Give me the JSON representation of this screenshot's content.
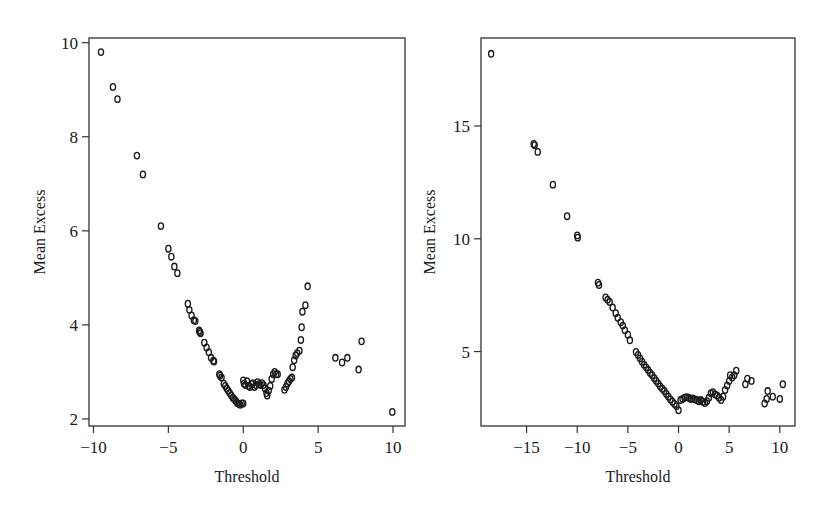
{
  "chart_data": [
    {
      "type": "scatter",
      "title": "",
      "xlabel": "Threshold",
      "ylabel": "Mean Excess",
      "xlim": [
        -10.3,
        10.8
      ],
      "ylim": [
        1.85,
        10.1
      ],
      "xticks": [
        -10,
        -5,
        0,
        5,
        10
      ],
      "xtick_labels": [
        "−10",
        "−5",
        "0",
        "5",
        "10"
      ],
      "yticks": [
        2,
        4,
        6,
        8,
        10
      ],
      "ytick_labels": [
        "2",
        "4",
        "6",
        "8",
        "10"
      ],
      "grid": false,
      "legend": null,
      "marker": "open-circle",
      "points": [
        [
          -9.5,
          9.8
        ],
        [
          -8.7,
          9.06
        ],
        [
          -8.4,
          8.8
        ],
        [
          -7.1,
          7.6
        ],
        [
          -6.7,
          7.2
        ],
        [
          -5.5,
          6.1
        ],
        [
          -5.0,
          5.62
        ],
        [
          -4.8,
          5.45
        ],
        [
          -4.6,
          5.24
        ],
        [
          -4.4,
          5.1
        ],
        [
          -3.7,
          4.45
        ],
        [
          -3.6,
          4.32
        ],
        [
          -3.45,
          4.2
        ],
        [
          -3.3,
          4.1
        ],
        [
          -3.2,
          4.08
        ],
        [
          -2.95,
          3.88
        ],
        [
          -2.9,
          3.85
        ],
        [
          -2.85,
          3.82
        ],
        [
          -2.6,
          3.62
        ],
        [
          -2.45,
          3.52
        ],
        [
          -2.3,
          3.42
        ],
        [
          -2.15,
          3.3
        ],
        [
          -2.0,
          3.24
        ],
        [
          -1.95,
          3.22
        ],
        [
          -1.6,
          2.95
        ],
        [
          -1.55,
          2.92
        ],
        [
          -1.45,
          2.88
        ],
        [
          -1.3,
          2.75
        ],
        [
          -1.2,
          2.7
        ],
        [
          -1.1,
          2.65
        ],
        [
          -1.0,
          2.6
        ],
        [
          -0.9,
          2.55
        ],
        [
          -0.8,
          2.5
        ],
        [
          -0.7,
          2.45
        ],
        [
          -0.6,
          2.42
        ],
        [
          -0.5,
          2.38
        ],
        [
          -0.4,
          2.34
        ],
        [
          -0.3,
          2.32
        ],
        [
          -0.2,
          2.3
        ],
        [
          -0.1,
          2.33
        ],
        [
          0.0,
          2.33
        ],
        [
          0.0,
          2.82
        ],
        [
          0.05,
          2.75
        ],
        [
          0.15,
          2.72
        ],
        [
          0.25,
          2.8
        ],
        [
          0.35,
          2.7
        ],
        [
          0.45,
          2.68
        ],
        [
          0.55,
          2.74
        ],
        [
          0.65,
          2.76
        ],
        [
          0.75,
          2.68
        ],
        [
          0.85,
          2.72
        ],
        [
          0.95,
          2.78
        ],
        [
          1.05,
          2.74
        ],
        [
          1.15,
          2.72
        ],
        [
          1.25,
          2.76
        ],
        [
          1.35,
          2.72
        ],
        [
          1.45,
          2.65
        ],
        [
          1.55,
          2.55
        ],
        [
          1.6,
          2.5
        ],
        [
          1.7,
          2.6
        ],
        [
          1.8,
          2.7
        ],
        [
          1.9,
          2.85
        ],
        [
          2.0,
          2.95
        ],
        [
          2.1,
          3.0
        ],
        [
          2.2,
          2.95
        ],
        [
          2.3,
          2.95
        ],
        [
          2.75,
          2.62
        ],
        [
          2.85,
          2.68
        ],
        [
          2.95,
          2.75
        ],
        [
          3.05,
          2.8
        ],
        [
          3.15,
          2.85
        ],
        [
          3.25,
          2.88
        ],
        [
          3.3,
          3.1
        ],
        [
          3.4,
          3.25
        ],
        [
          3.5,
          3.35
        ],
        [
          3.6,
          3.4
        ],
        [
          3.75,
          3.45
        ],
        [
          3.85,
          3.68
        ],
        [
          3.9,
          3.95
        ],
        [
          3.95,
          4.28
        ],
        [
          4.15,
          4.42
        ],
        [
          4.3,
          4.82
        ],
        [
          6.15,
          3.3
        ],
        [
          6.6,
          3.2
        ],
        [
          6.95,
          3.3
        ],
        [
          7.7,
          3.05
        ],
        [
          7.9,
          3.65
        ],
        [
          9.95,
          2.15
        ]
      ]
    },
    {
      "type": "scatter",
      "title": "",
      "xlabel": "Threshold",
      "ylabel": "Mean Excess",
      "xlim": [
        -19.5,
        11.5
      ],
      "ylim": [
        1.7,
        18.9
      ],
      "xticks": [
        -15,
        -10,
        -5,
        0,
        5,
        10
      ],
      "xtick_labels": [
        "−15",
        "−10",
        "−5",
        "0",
        "5",
        "10"
      ],
      "yticks": [
        5,
        10,
        15
      ],
      "ytick_labels": [
        "5",
        "10",
        "15"
      ],
      "grid": false,
      "legend": null,
      "marker": "open-circle",
      "points": [
        [
          -18.5,
          18.2
        ],
        [
          -14.3,
          14.2
        ],
        [
          -14.2,
          14.15
        ],
        [
          -13.9,
          13.85
        ],
        [
          -12.4,
          12.4
        ],
        [
          -11.0,
          11.0
        ],
        [
          -10.0,
          10.15
        ],
        [
          -9.95,
          10.05
        ],
        [
          -7.95,
          8.05
        ],
        [
          -7.85,
          7.95
        ],
        [
          -7.2,
          7.4
        ],
        [
          -7.0,
          7.3
        ],
        [
          -6.8,
          7.2
        ],
        [
          -6.5,
          6.95
        ],
        [
          -6.2,
          6.7
        ],
        [
          -6.0,
          6.5
        ],
        [
          -5.7,
          6.3
        ],
        [
          -5.5,
          6.15
        ],
        [
          -5.3,
          5.95
        ],
        [
          -5.0,
          5.75
        ],
        [
          -4.8,
          5.5
        ],
        [
          -4.2,
          4.98
        ],
        [
          -4.0,
          4.85
        ],
        [
          -3.8,
          4.7
        ],
        [
          -3.6,
          4.55
        ],
        [
          -3.4,
          4.42
        ],
        [
          -3.2,
          4.3
        ],
        [
          -3.0,
          4.18
        ],
        [
          -2.8,
          4.05
        ],
        [
          -2.6,
          3.95
        ],
        [
          -2.4,
          3.82
        ],
        [
          -2.2,
          3.7
        ],
        [
          -2.0,
          3.58
        ],
        [
          -1.8,
          3.45
        ],
        [
          -1.6,
          3.35
        ],
        [
          -1.4,
          3.25
        ],
        [
          -1.2,
          3.12
        ],
        [
          -1.0,
          3.0
        ],
        [
          -0.8,
          2.88
        ],
        [
          -0.6,
          2.78
        ],
        [
          -0.4,
          2.68
        ],
        [
          -0.2,
          2.58
        ],
        [
          0.0,
          2.4
        ],
        [
          0.2,
          2.85
        ],
        [
          0.4,
          2.9
        ],
        [
          0.6,
          2.95
        ],
        [
          0.8,
          2.98
        ],
        [
          1.0,
          2.95
        ],
        [
          1.2,
          2.9
        ],
        [
          1.4,
          2.92
        ],
        [
          1.6,
          2.88
        ],
        [
          1.8,
          2.85
        ],
        [
          2.0,
          2.8
        ],
        [
          2.2,
          2.85
        ],
        [
          2.4,
          2.78
        ],
        [
          2.6,
          2.72
        ],
        [
          2.8,
          2.8
        ],
        [
          3.0,
          2.95
        ],
        [
          3.2,
          3.15
        ],
        [
          3.4,
          3.2
        ],
        [
          3.6,
          3.1
        ],
        [
          3.8,
          3.05
        ],
        [
          4.0,
          2.95
        ],
        [
          4.2,
          2.85
        ],
        [
          4.4,
          3.0
        ],
        [
          4.6,
          3.3
        ],
        [
          4.8,
          3.5
        ],
        [
          5.0,
          3.7
        ],
        [
          5.1,
          3.95
        ],
        [
          5.3,
          3.85
        ],
        [
          5.5,
          3.95
        ],
        [
          5.7,
          4.15
        ],
        [
          6.6,
          3.55
        ],
        [
          6.8,
          3.8
        ],
        [
          7.2,
          3.7
        ],
        [
          8.5,
          2.7
        ],
        [
          8.7,
          2.9
        ],
        [
          8.8,
          3.25
        ],
        [
          9.3,
          3.0
        ],
        [
          10.0,
          2.9
        ],
        [
          10.3,
          3.55
        ]
      ]
    }
  ]
}
